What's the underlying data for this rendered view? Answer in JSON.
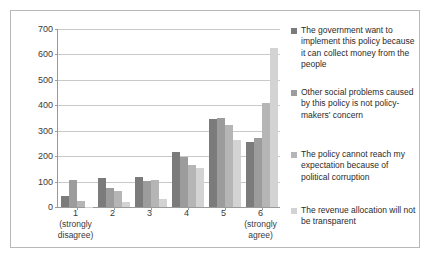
{
  "chart_data": {
    "type": "bar",
    "title": "",
    "xlabel": "",
    "ylabel": "",
    "ylim": [
      0,
      700
    ],
    "ytick_step": 100,
    "grid": true,
    "legend_position": "right",
    "categories": [
      "1",
      "2",
      "3",
      "4",
      "5",
      "6"
    ],
    "category_sublabels": [
      "(strongly\ndisagree)",
      "",
      "",
      "",
      "",
      "(strongly\nagree)"
    ],
    "yticks": [
      "0",
      "100",
      "200",
      "300",
      "400",
      "500",
      "600",
      "700"
    ],
    "series": [
      {
        "name": "The government want to implement this policy because it can collect money from the people",
        "color": "#7b7b7b",
        "values": [
          45,
          113,
          119,
          215,
          348,
          254
        ]
      },
      {
        "name": "Other social problems caused by this policy is not policy-makers' concern",
        "color": "#9c9c9c",
        "values": [
          105,
          73,
          101,
          197,
          351,
          271
        ]
      },
      {
        "name": "The policy cannot reach my expectation because of political corruption",
        "color": "#b5b5b5",
        "values": [
          25,
          63,
          106,
          167,
          324,
          408
        ]
      },
      {
        "name": "The revenue allocation will not be transparent",
        "color": "#d3d3d3",
        "values": [
          2,
          18,
          30,
          155,
          263,
          624
        ]
      }
    ]
  },
  "legend": {
    "items": [
      {
        "label": "The government want to implement this policy because it can collect money from the people",
        "color": "#7b7b7b"
      },
      {
        "label": "Other social problems caused by this policy is not policy-makers' concern",
        "color": "#9c9c9c"
      },
      {
        "label": "The policy cannot reach my expectation because of political corruption",
        "color": "#b5b5b5"
      },
      {
        "label": "The revenue allocation will not be transparent",
        "color": "#d3d3d3"
      }
    ]
  },
  "axis": {
    "x_categories": [
      {
        "label": "1",
        "sublabel1": "(strongly",
        "sublabel2": "disagree)"
      },
      {
        "label": "2",
        "sublabel1": "",
        "sublabel2": ""
      },
      {
        "label": "3",
        "sublabel1": "",
        "sublabel2": ""
      },
      {
        "label": "4",
        "sublabel1": "",
        "sublabel2": ""
      },
      {
        "label": "5",
        "sublabel1": "",
        "sublabel2": ""
      },
      {
        "label": "6",
        "sublabel1": "(strongly",
        "sublabel2": "agree)"
      }
    ]
  },
  "colors": {
    "frame_border": "#b8b8b8",
    "axis_line": "#9a9a9a",
    "gridline": "#c9c9c9",
    "text": "#2b2b2b"
  }
}
